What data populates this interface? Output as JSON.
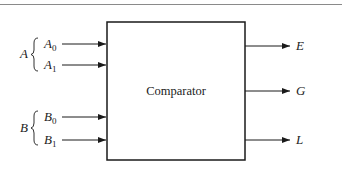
{
  "diagram": {
    "block": {
      "label": "Comparator"
    },
    "input_groups": [
      {
        "name": "A",
        "inputs": [
          {
            "base": "A",
            "sub": "0"
          },
          {
            "base": "A",
            "sub": "1"
          }
        ]
      },
      {
        "name": "B",
        "inputs": [
          {
            "base": "B",
            "sub": "0"
          },
          {
            "base": "B",
            "sub": "1"
          }
        ]
      }
    ],
    "outputs": [
      {
        "label": "E"
      },
      {
        "label": "G"
      },
      {
        "label": "L"
      }
    ],
    "colors": {
      "line": "#1a1a1a",
      "rule": "#8a8a8a",
      "background": "#ffffff"
    }
  }
}
